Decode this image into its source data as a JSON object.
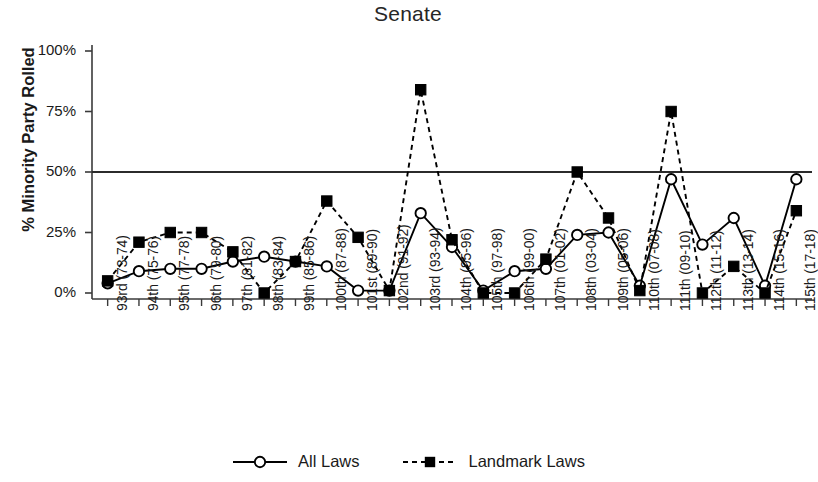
{
  "chart_data": {
    "type": "line",
    "title": "Senate",
    "xlabel": "",
    "ylabel": "% Minority Party Rolled",
    "ylim": [
      0,
      100
    ],
    "yticks": [
      0,
      25,
      50,
      75,
      100
    ],
    "ytick_labels": [
      "0%",
      "25%",
      "50%",
      "75%",
      "100%"
    ],
    "grid": false,
    "legend_position": "bottom-center",
    "reference_line": {
      "value": 50,
      "style": "solid",
      "label": ""
    },
    "categories": [
      "93rd (73-74)",
      "94th (75-76)",
      "95th (77-78)",
      "96th (79-80)",
      "97th (81-82)",
      "98th (83-84)",
      "99th (85-86)",
      "100th (87-88)",
      "101st (89-90)",
      "102nd (91-92)",
      "103rd (93-94)",
      "104th (95-96)",
      "105th (97-98)",
      "106th (99-00)",
      "107th (01-02)",
      "108th (03-04)",
      "109th (05-06)",
      "110th (07-08)",
      "111th (09-10)",
      "112th (11-12)",
      "113th (13-14)",
      "114th (15-16)",
      "115th (17-18)"
    ],
    "series": [
      {
        "name": "All Laws",
        "marker": "open-circle",
        "line_style": "solid",
        "color": "#000000",
        "values": [
          4,
          9,
          10,
          10,
          13,
          15,
          13,
          11,
          1,
          1,
          33,
          19,
          1,
          9,
          10,
          24,
          25,
          3,
          47,
          20,
          31,
          3,
          47
        ]
      },
      {
        "name": "Landmark Laws",
        "marker": "filled-square",
        "line_style": "dashed",
        "color": "#000000",
        "values": [
          5,
          21,
          25,
          25,
          17,
          0,
          13,
          38,
          23,
          1,
          84,
          22,
          0,
          0,
          14,
          50,
          31,
          1,
          75,
          0,
          11,
          0,
          34
        ]
      }
    ]
  },
  "legend": {
    "entries": [
      {
        "label": "All Laws",
        "marker": "open-circle",
        "line_style": "solid"
      },
      {
        "label": "Landmark Laws",
        "marker": "filled-square",
        "line_style": "dashed"
      }
    ]
  }
}
